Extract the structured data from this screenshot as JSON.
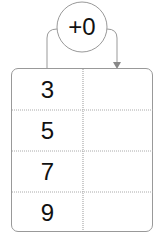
{
  "operation": {
    "label": "+0"
  },
  "table": {
    "left_values": [
      "3",
      "5",
      "7",
      "9"
    ],
    "right_values": [
      "",
      "",
      "",
      ""
    ]
  },
  "colors": {
    "line": "#999999",
    "text": "#111111",
    "arrow": "#888888"
  }
}
